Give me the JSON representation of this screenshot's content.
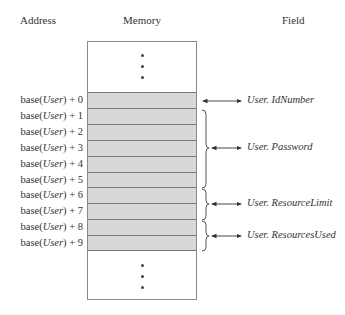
{
  "headers": {
    "address": "Address",
    "memory": "Memory",
    "field": "Field"
  },
  "address_prefix": "base(",
  "address_var": "User",
  "addresses": [
    {
      "offset": ") + 0"
    },
    {
      "offset": ") + 1"
    },
    {
      "offset": ") + 2"
    },
    {
      "offset": ") + 3"
    },
    {
      "offset": ") + 4"
    },
    {
      "offset": ") + 5"
    },
    {
      "offset": ") + 6"
    },
    {
      "offset": ") + 7"
    },
    {
      "offset": ") + 8"
    },
    {
      "offset": ") + 9"
    }
  ],
  "fields": [
    {
      "label": "User. IdNumber",
      "rows": [
        0
      ]
    },
    {
      "label": "User. Password",
      "rows": [
        1,
        5
      ]
    },
    {
      "label": "User. ResourceLimit",
      "rows": [
        6,
        7
      ]
    },
    {
      "label": "User. ResourcesUsed",
      "rows": [
        8,
        9
      ]
    }
  ],
  "ellipsis_top": "⋮",
  "ellipsis_bottom": "⋮",
  "colors": {
    "cell_fill": "#d8d8d8",
    "border": "#888888"
  }
}
